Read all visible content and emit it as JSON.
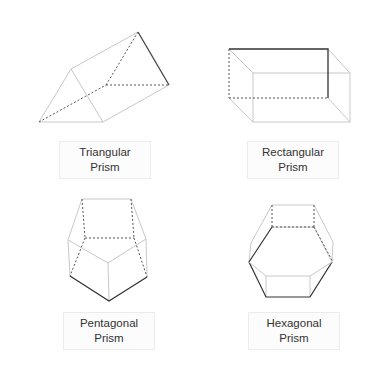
{
  "colors": {
    "edge_light": "#c8c8c8",
    "edge_dark": "#333333",
    "dashed": "#555555",
    "label_text": "#333333"
  },
  "shapes": [
    {
      "name": "Triangular Prism",
      "label_line1": "Triangular",
      "label_line2": "Prism"
    },
    {
      "name": "Rectangular Prism",
      "label_line1": "Rectangular",
      "label_line2": "Prism"
    },
    {
      "name": "Pentagonal Prism",
      "label_line1": "Pentagonal",
      "label_line2": "Prism"
    },
    {
      "name": "Hexagonal Prism",
      "label_line1": "Hexagonal",
      "label_line2": "Prism"
    }
  ]
}
